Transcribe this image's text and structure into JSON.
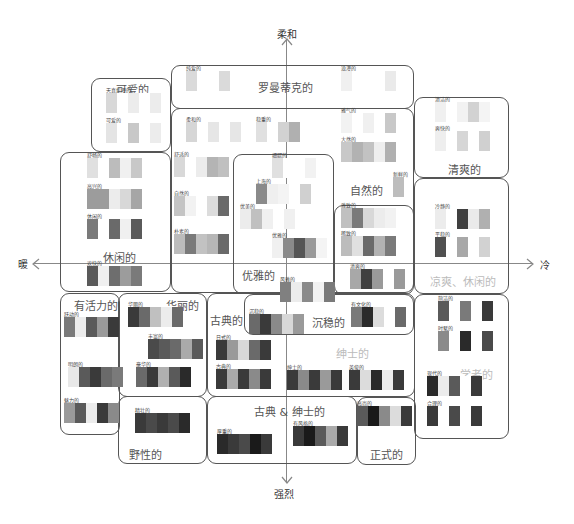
{
  "axes": {
    "top": "柔和",
    "bottom": "强烈",
    "left": "暖",
    "right": "冷"
  },
  "groups": {
    "cute": {
      "title": "可爱的",
      "palettes": [
        {
          "label": "天真烂漫的",
          "colors": [
            "#d8d8d8",
            "#fff",
            "#ececec",
            "#fff",
            "#ececec"
          ]
        },
        {
          "label": "可爱的",
          "colors": [
            "#e4e4e4",
            "#fff",
            "#c8c8c8",
            "#fff",
            "#ececec"
          ]
        }
      ]
    },
    "romantic": {
      "title": "罗曼蒂克的",
      "palettes": [
        {
          "label": "纯爱的",
          "colors": [
            "#dadada",
            "#fff",
            "#fff",
            "#dadada"
          ]
        },
        {
          "label": "浪漫的",
          "colors": [
            "#f0f0f0",
            "#fff",
            "#fff",
            "#fff",
            "#eaeaea"
          ]
        }
      ]
    },
    "natural": {
      "title": "自然的",
      "palettes": [
        {
          "label": "柔和的",
          "colors": [
            "#d6d6d6",
            "#fff",
            "#e6e6e6",
            "#fff",
            "#e6e6e6"
          ]
        },
        {
          "label": "稳重的",
          "colors": [
            "#e0e0e0",
            "#fff",
            "#d2d2d2",
            "#b0b0b0"
          ]
        },
        {
          "label": "雅气的",
          "colors": [
            "#f2f2f2",
            "#fff",
            "#f0f0f0",
            "#fff",
            "#c8c8c8"
          ]
        },
        {
          "label": "大然的",
          "colors": [
            "#c8c8c8",
            "#b2b2b2",
            "#c2c2c2",
            "#eee",
            "#b0b0b0"
          ]
        },
        {
          "label": "舒适的",
          "colors": [
            "#d8d8d8",
            "#fff",
            "#ececec",
            "#b4b4b4",
            "#c0c0c0"
          ]
        },
        {
          "label": "自然的",
          "colors": [
            "#c4c4c4",
            "#f2f2f2",
            "#fff",
            "#dcdcdc",
            "#6a6a6a"
          ]
        },
        {
          "label": "朴素的",
          "colors": [
            "#bcbcbc",
            "#7a7a7a",
            "#c2c2c2",
            "#b6b6b6",
            "#6a6a6a"
          ]
        },
        {
          "label": "新鲜的",
          "colors": [
            "#bdbdbd"
          ]
        }
      ]
    },
    "fresh": {
      "title": "清爽的",
      "palettes": [
        {
          "label": "清洁的",
          "colors": [
            "#f0f0f0",
            "#fff",
            "#f2f2f2",
            "#d2d2d2",
            "#f4f4f4"
          ]
        },
        {
          "label": "爽快的",
          "colors": [
            "#eeeeee",
            "#fff",
            "#d6d6d6",
            "#fff",
            "#d0d0d0"
          ]
        }
      ]
    },
    "relaxed": {
      "title": "休闲的",
      "palettes": [
        {
          "label": "舒畅的",
          "colors": [
            "#e0e0e0",
            "#fff",
            "#bcbcbc",
            "#f0f0f0",
            "#c8c8c8"
          ]
        },
        {
          "label": "高兴的",
          "colors": [
            "#9c9c9c",
            "#9c9c9c",
            "#ececec",
            "#d8d8d8",
            "#a6a6a6"
          ]
        },
        {
          "label": "休闲的",
          "colors": [
            "#7a7a7a",
            "#fff",
            "#6a6a6a",
            "#f0f0f0",
            "#5a5a5a"
          ]
        },
        {
          "label": "欢快的",
          "colors": [
            "#5a5a5a",
            "#f0f0f0",
            "#6e6e6e",
            "#9c9c9c",
            "#7a7a7a"
          ]
        }
      ]
    },
    "elegant": {
      "title": "优雅的",
      "palettes": [
        {
          "label": "细腻的",
          "colors": [
            "#e0e0e0",
            "#fff",
            "#fff",
            "#f2f2f2"
          ]
        },
        {
          "label": "上海的",
          "colors": [
            "#8a8a8a",
            "#efefef",
            "#f4f4f4",
            "#fff",
            "#d0d0d0"
          ]
        },
        {
          "label": "优美的",
          "colors": [
            "#ececec",
            "#c0c0c0",
            "#f0f0f0",
            "#fff",
            "#f0f0f0"
          ]
        },
        {
          "label": "优雅的",
          "colors": [
            "#f0f0f0",
            "#8a8a8a",
            "#555",
            "#999",
            "#f4f4f4"
          ]
        },
        {
          "label": "风雅的",
          "colors": [
            "#808080",
            "#ececec",
            "#8a8a8a",
            "#f2f2f2",
            "#7a7a7a"
          ]
        }
      ]
    },
    "cool_casual": {
      "title": "凉爽、休闲的",
      "palettes": [
        {
          "label": "雅致的",
          "colors": [
            "#c0c0c0",
            "#7a7a7a",
            "#d8d8d8",
            "#ececec",
            "#f2f2f2"
          ]
        },
        {
          "label": "稀致的",
          "colors": [
            "#bcbcbc",
            "#e0e0e0",
            "#6a6a6a",
            "#b2b2b2",
            "#7a7a7a"
          ]
        },
        {
          "label": "清爽的",
          "colors": [
            "#a8a8a8",
            "#404040",
            "#9a9a9a",
            "#fff",
            "#9a9a9a"
          ]
        },
        {
          "label": "冷静的",
          "colors": [
            "#ececec",
            "#fff",
            "#404040",
            "#eaeaea",
            "#b0b0b0"
          ]
        },
        {
          "label": "平稳的",
          "colors": [
            "#505050",
            "#fff",
            "#a8a8a8",
            "#fff",
            "#d2d2d2"
          ]
        }
      ]
    },
    "lively": {
      "title": "有活力的",
      "palettes": [
        {
          "label": "跃动的",
          "colors": [
            "#7a7a7a",
            "#ececec",
            "#5a5a5a",
            "#9a9a9a",
            "#3a3a3a"
          ]
        },
        {
          "label": "明朗的",
          "colors": [
            "#e8e8e8",
            "#5a5a5a",
            "#3a3a3a",
            "#6a6a6a",
            "#7a7a7a"
          ]
        },
        {
          "label": "魅力的",
          "colors": [
            "#9a9a9a",
            "#5a5a5a",
            "#ececec",
            "#3a3a3a",
            "#8a8a8a"
          ]
        }
      ]
    },
    "gorgeous": {
      "title": "华丽的",
      "palettes": [
        {
          "label": "华丽的",
          "colors": [
            "#3a3a3a",
            "#6a6a6a",
            "#c0c0c0",
            "#ececec",
            "#6a6a6a"
          ]
        },
        {
          "label": "丰富的",
          "colors": [
            "#4a4a4a",
            "#5a5a5a",
            "#6a6a6a",
            "#aaaaaa",
            "#5a5a5a"
          ]
        },
        {
          "label": "豪华的",
          "colors": [
            "#6a6a6a",
            "#3a3a3a",
            "#b0b0b0",
            "#5a5a5a",
            "#2a2a2a"
          ]
        }
      ]
    },
    "classic": {
      "title": "古典的",
      "palettes": [
        {
          "label": "日式的",
          "colors": [
            "#3a3a3a",
            "#9a9a9a",
            "#d8d8d8",
            "#6a6a6a",
            "#3a3a3a"
          ]
        },
        {
          "label": "古典的",
          "colors": [
            "#3a3a3a",
            "#aaaaaa",
            "#3a3a3a",
            "#8a8a8a",
            "#3a3a3a"
          ]
        }
      ]
    },
    "calm": {
      "title": "沉稳的",
      "palettes": [
        {
          "label": "沉稳的",
          "colors": [
            "#6a6a6a",
            "#3a3a3a",
            "#8a8a8a",
            "#d8d8d8",
            "#9a9a9a"
          ]
        },
        {
          "label": "有文化的",
          "colors": [
            "#7a7a7a",
            "#2a2a2a",
            "#dcdcdc",
            "#fff",
            "#6a6a6a"
          ]
        }
      ]
    },
    "gentleman": {
      "title": "绅士的",
      "palettes": [
        {
          "label": "绅士的",
          "colors": [
            "#3a3a3a",
            "#8a8a8a",
            "#3a3a3a",
            "#9a9a9a",
            "#3a3a3a"
          ]
        },
        {
          "label": "英俊的",
          "colors": [
            "#3a3a3a",
            "#dcdcdc",
            "#2a2a2a",
            "#ececec",
            "#3a3a3a"
          ]
        }
      ]
    },
    "scholarly": {
      "title": "学者的",
      "palettes": [
        {
          "label": "简洁的",
          "colors": [
            "#5a5a5a",
            "#fff",
            "#7a7a7a",
            "#fff",
            "#3a3a3a"
          ]
        },
        {
          "label": "时髦的",
          "colors": [
            "#8a8a8a",
            "#fff",
            "#2a2a2a",
            "#fff",
            "#4a4a4a"
          ]
        },
        {
          "label": "现代的",
          "colors": [
            "#2a2a2a",
            "#ececec",
            "#5a5a5a",
            "#fff",
            "#3a3a3a"
          ]
        },
        {
          "label": "合理的",
          "colors": [
            "#3a3a3a",
            "#fff",
            "#4a4a4a",
            "#fff",
            "#3a3a3a"
          ]
        }
      ]
    },
    "wild": {
      "title": "野性的",
      "palettes": [
        {
          "label": "精壮的",
          "colors": [
            "#3a3a3a",
            "#4a4a4a",
            "#3a3a3a",
            "#4a4a4a",
            "#2a2a2a"
          ]
        }
      ]
    },
    "classic_gentleman": {
      "title": "古典 & 绅士的",
      "palettes": [
        {
          "label": "厚重的",
          "colors": [
            "#2a2a2a",
            "#3a3a3a",
            "#4a4a4a",
            "#1a1a1a",
            "#3a3a3a"
          ]
        },
        {
          "label": "有风格的",
          "colors": [
            "#3a3a3a",
            "#1a1a1a",
            "#5a5a5a",
            "#aaaaaa",
            "#3a3a3a"
          ]
        }
      ]
    },
    "formal": {
      "title": "正式的",
      "palettes": [
        {
          "label": "高尚的",
          "colors": [
            "#5a5a5a",
            "#1a1a1a",
            "#8a8a8a",
            "#dcdcdc",
            "#3a3a3a"
          ]
        }
      ]
    }
  }
}
